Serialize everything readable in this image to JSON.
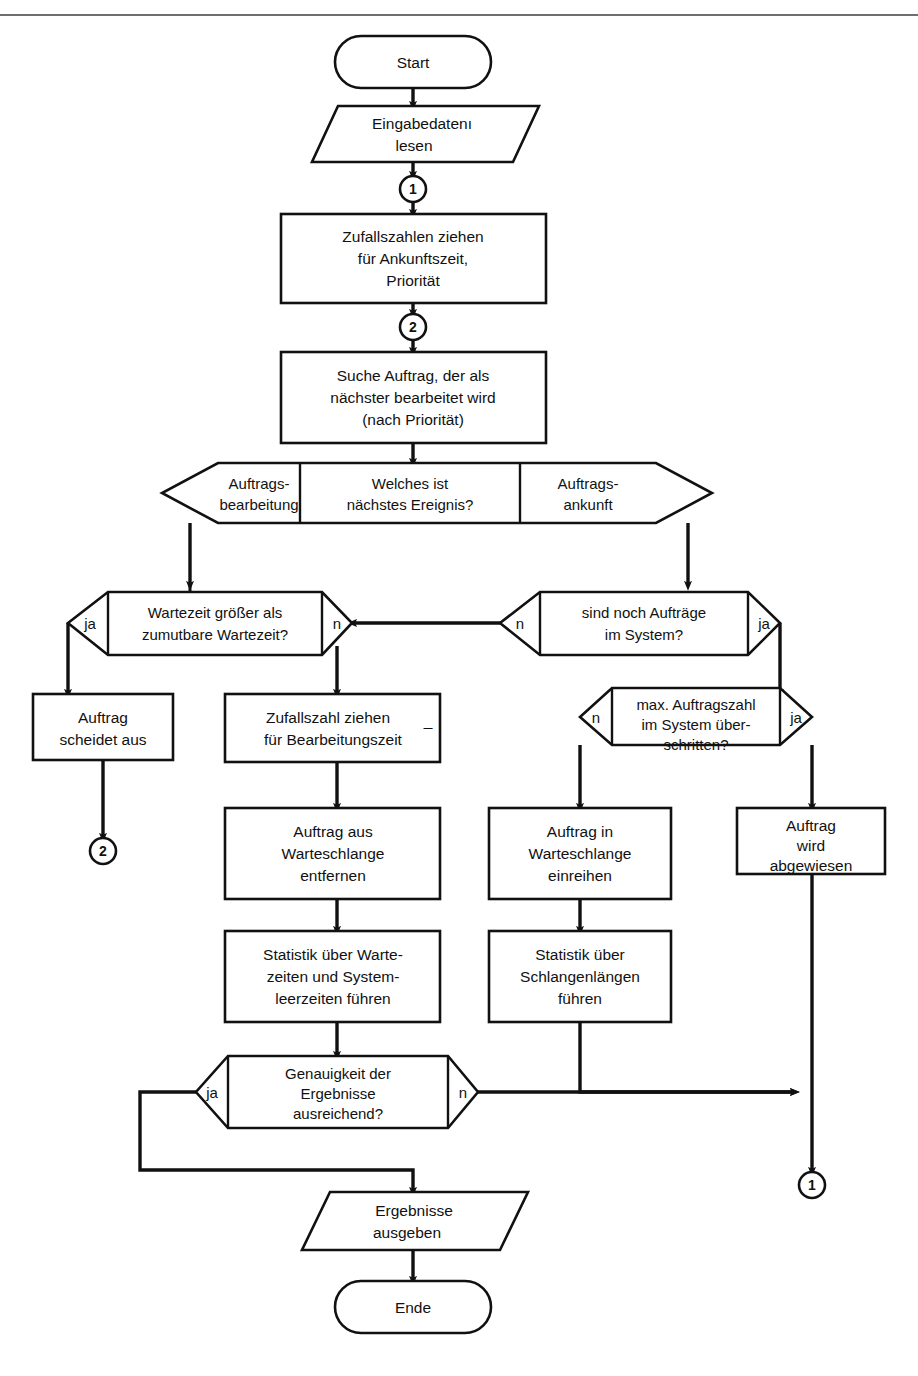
{
  "page": {
    "kind": "flowchart",
    "language": "de",
    "top_rule_color": "#6f6f6f",
    "line_color": "#111111",
    "fill_color": "#ffffff"
  },
  "nodes": {
    "start": {
      "shape": "terminator",
      "label": "Start"
    },
    "input_read": {
      "shape": "parallelogram",
      "line1": "Eingabedatenı",
      "line2": "lesen"
    },
    "conn_1a": {
      "shape": "connector",
      "label": "1"
    },
    "random_arrival": {
      "shape": "process",
      "line1": "Zufallszahlen ziehen",
      "line2": "für Ankunftszeit,",
      "line3": "Priorität"
    },
    "conn_2a": {
      "shape": "connector",
      "label": "2"
    },
    "search_job": {
      "shape": "process",
      "line1": "Suche Auftrag, der als",
      "line2": "nächster bearbeitet wird",
      "line3": "(nach Priorität)"
    },
    "event_switch": {
      "shape": "hex-3way",
      "left_line1": "Auftrags-",
      "left_line2": "bearbeitung",
      "center_line1": "Welches ist",
      "center_line2": "nächstes Ereignis?",
      "right_line1": "Auftrags-",
      "right_line2": "ankunft"
    },
    "wait_check": {
      "shape": "hex-decision",
      "line1": "Wartezeit größer als",
      "line2": "zumutbare Wartezeit?",
      "left_label": "ja",
      "right_label": "n"
    },
    "jobs_left": {
      "shape": "hex-decision",
      "line1": "sind noch Aufträge",
      "line2": "im System?",
      "left_label": "n",
      "right_label": "ja"
    },
    "job_drops": {
      "shape": "process",
      "line1": "Auftrag",
      "line2": "scheidet aus"
    },
    "random_service": {
      "shape": "process",
      "line1": "Zufallszahl ziehen",
      "line2": "für Bearbeitungszeit",
      "mark": "_"
    },
    "max_jobs": {
      "shape": "hex-decision",
      "line1": "max. Auftragszahl",
      "line2": "im System über-",
      "line3": "schritten?",
      "left_label": "n",
      "right_label": "ja"
    },
    "conn_2b": {
      "shape": "connector",
      "label": "2"
    },
    "remove_queue": {
      "shape": "process",
      "line1": "Auftrag aus",
      "line2": "Warteschlange",
      "line3": "entfernen"
    },
    "enqueue": {
      "shape": "process",
      "line1": "Auftrag in",
      "line2": "Warteschlange",
      "line3": "einreihen"
    },
    "rejected": {
      "shape": "process",
      "line1": "Auftrag",
      "line2": "wird",
      "line3": "abgewiesen"
    },
    "stat_wait": {
      "shape": "process",
      "line1": "Statistik über Warte-",
      "line2": "zeiten und System-",
      "line3": "leerzeiten führen"
    },
    "stat_queue": {
      "shape": "process",
      "line1": "Statistik über",
      "line2": "Schlangenlängen",
      "line3": "führen"
    },
    "accuracy": {
      "shape": "hex-decision",
      "line1": "Genauigkeit der",
      "line2": "Ergebnisse",
      "line3": "ausreichend?",
      "left_label": "ja",
      "right_label": "n"
    },
    "conn_1b": {
      "shape": "connector",
      "label": "1"
    },
    "output_results": {
      "shape": "parallelogram",
      "line1": "Ergebnisse",
      "line2": "ausgeben"
    },
    "end": {
      "shape": "terminator",
      "label": "Ende"
    }
  }
}
